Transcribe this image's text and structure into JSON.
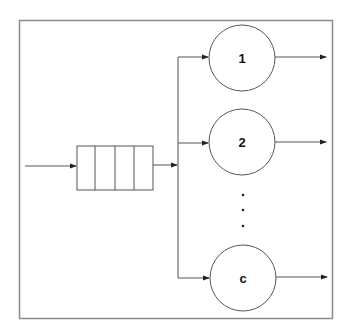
{
  "diagram": {
    "type": "multi-server queue (M/M/c)",
    "queue": {
      "slots": 4
    },
    "servers": [
      {
        "label": "1"
      },
      {
        "label": "2"
      },
      {
        "label": "c"
      }
    ],
    "ellipsis": "· · ·",
    "colors": {
      "stroke": "#555555",
      "frame": "#888888",
      "text": "#111111",
      "background": "#ffffff"
    }
  }
}
